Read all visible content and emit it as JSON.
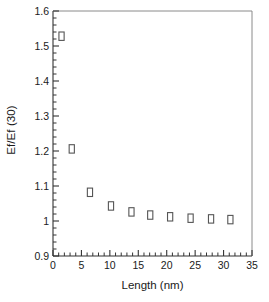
{
  "chart_data": {
    "type": "scatter",
    "title": "",
    "xlabel": "Length (nm)",
    "ylabel": "Ef/Ef (30)",
    "xlim": [
      0,
      35
    ],
    "ylim": [
      0.9,
      1.6
    ],
    "xticks": [
      "0",
      "5",
      "10",
      "15",
      "20",
      "25",
      "30",
      "35"
    ],
    "xtick_values": [
      0,
      5,
      10,
      15,
      20,
      25,
      30,
      35
    ],
    "yticks": [
      "0.9",
      "1",
      "1.1",
      "1.2",
      "1.3",
      "1.4",
      "1.5",
      "1.6"
    ],
    "ytick_values": [
      0.9,
      1.0,
      1.1,
      1.2,
      1.3,
      1.4,
      1.5,
      1.6
    ],
    "x_minor_step": 1,
    "y_minor_step": 0.02,
    "grid": false,
    "legend": null,
    "marker": "open-square",
    "marker_color": "#555555",
    "series": [
      {
        "name": "Ef/Ef(30) vs Length",
        "x": [
          1.5,
          3.3,
          6.5,
          10.2,
          13.8,
          17.1,
          20.6,
          24.2,
          27.8,
          31.2
        ],
        "y": [
          1.528,
          1.206,
          1.082,
          1.043,
          1.026,
          1.017,
          1.012,
          1.008,
          1.006,
          1.004
        ]
      }
    ]
  }
}
